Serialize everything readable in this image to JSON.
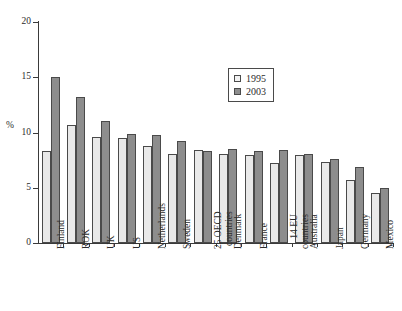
{
  "chart_data": {
    "type": "bar",
    "title": "",
    "subtitle": "",
    "xlabel": "",
    "ylabel": "%",
    "ylim": [
      0,
      20
    ],
    "yticks": [
      0,
      5,
      10,
      15,
      20
    ],
    "ytick_labels": [
      "0",
      "5",
      "10",
      "15",
      "20"
    ],
    "grid": false,
    "legend_position": "inside-top-right",
    "categories": [
      "Finland",
      "ROK",
      "UK",
      "US",
      "Netherlands",
      "Sweden",
      "25 OECD countries",
      "Denmark",
      "France",
      "14 EU countries",
      "Australia",
      "Japan",
      "Germany",
      "Mexico"
    ],
    "category_lines": [
      [
        "Finland"
      ],
      [
        "ROK"
      ],
      [
        "UK"
      ],
      [
        "US"
      ],
      [
        "Netherlands"
      ],
      [
        "Sweden"
      ],
      [
        "25 OECD",
        "countries"
      ],
      [
        "Denmark"
      ],
      [
        "France"
      ],
      [
        "14 EU",
        "countries"
      ],
      [
        "Australia"
      ],
      [
        "Japan"
      ],
      [
        "Germany"
      ],
      [
        "Mexico"
      ]
    ],
    "series": [
      {
        "name": "1995",
        "color": "#e9e9e9",
        "values": [
          8.3,
          10.7,
          9.6,
          9.5,
          8.8,
          8.1,
          8.4,
          8.1,
          8.0,
          7.2,
          8.0,
          7.3,
          5.7,
          4.5
        ]
      },
      {
        "name": "2003",
        "color": "#8d8d8d",
        "values": [
          15.0,
          13.2,
          11.0,
          9.9,
          9.8,
          9.2,
          8.3,
          8.5,
          8.3,
          8.4,
          8.1,
          7.6,
          6.9,
          5.0
        ]
      }
    ]
  },
  "legend": {
    "items": [
      {
        "label": "1995",
        "swatch": "light-swatch"
      },
      {
        "label": "2003",
        "swatch": "dark-swatch"
      }
    ]
  },
  "axis": {
    "y_title": "%"
  }
}
